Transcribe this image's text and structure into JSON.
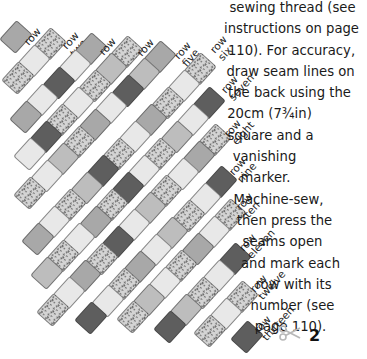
{
  "instructions": {
    "lines": [
      {
        "text": "sewing thread (see",
        "indent": 8
      },
      {
        "text": "instructions on page",
        "indent": 6
      },
      {
        "text": "110). For accuracy,",
        "indent": 6
      },
      {
        "text": "draw seam lines on",
        "indent": 4
      },
      {
        "text": "the back using the",
        "indent": 2
      },
      {
        "text": "20cm (7¾in)",
        "indent": -38
      },
      {
        "text": "square and a",
        "indent": -36
      },
      {
        "text": "vanishing",
        "indent": -48
      },
      {
        "text": "marker.",
        "indent": -46
      },
      {
        "text": "Machine-sew,",
        "indent": -20
      },
      {
        "text": "then press the",
        "indent": -8
      },
      {
        "text": "seams open",
        "indent": -12
      },
      {
        "text": "and mark each",
        "indent": 4
      },
      {
        "text": "row with its",
        "indent": 10
      },
      {
        "text": "number (see",
        "indent": 8
      },
      {
        "text": "page 110).",
        "indent": 4
      }
    ]
  },
  "step": {
    "number": "2",
    "icon": "scissors-icon"
  },
  "colors": {
    "M": "#a8a8a8",
    "G": "#bdbdbd",
    "L": "#e8e8e8",
    "D": "#5e5e5e",
    "T": "#d4d4d4"
  },
  "quilt": {
    "step_x": -16.2,
    "step_y": 17.0,
    "rotation_deg": 42,
    "rows": [
      {
        "label": "row\none",
        "x": 16,
        "y": 37,
        "label_x": 22,
        "label_y": 34,
        "shades": [
          "M"
        ]
      },
      {
        "label": "row\ntwo",
        "x": 50,
        "y": 44,
        "label_x": 60,
        "label_y": 38,
        "shades": [
          "T",
          "L",
          "T"
        ]
      },
      {
        "label": "row\nthree",
        "x": 91,
        "y": 49,
        "label_x": 97,
        "label_y": 44,
        "shades": [
          "M",
          "L",
          "D",
          "L",
          "M"
        ]
      },
      {
        "label": "row\nfour",
        "x": 127,
        "y": 52,
        "label_x": 135,
        "label_y": 45,
        "shades": [
          "T",
          "G",
          "T",
          "L",
          "T",
          "D",
          "L"
        ]
      },
      {
        "label": "row\nfive",
        "x": 160,
        "y": 57,
        "label_x": 172,
        "label_y": 48,
        "shades": [
          "M",
          "G",
          "D",
          "L",
          "M",
          "T",
          "G",
          "L",
          "T"
        ]
      },
      {
        "label": "row\nsix",
        "x": 200,
        "y": 69,
        "label_x": 208,
        "label_y": 42,
        "shades": [
          "T",
          "L",
          "T",
          "M",
          "L",
          "T",
          "D",
          "G",
          "T",
          "L",
          "M"
        ]
      },
      {
        "label": "row\nseven",
        "x": 209,
        "y": 103,
        "label_x": 219,
        "label_y": 82,
        "shades": [
          "D",
          "L",
          "G",
          "T",
          "L",
          "D",
          "T",
          "M",
          "L",
          "T",
          "G"
        ]
      },
      {
        "label": "row\neight",
        "x": 215,
        "y": 140,
        "label_x": 222,
        "label_y": 126,
        "shades": [
          "T",
          "M",
          "L",
          "T",
          "G",
          "L",
          "D",
          "T",
          "M",
          "L",
          "T"
        ]
      },
      {
        "label": "row\nnine",
        "x": 221,
        "y": 182,
        "label_x": 227,
        "label_y": 164,
        "shades": [
          "D",
          "L",
          "T",
          "G",
          "L",
          "M",
          "T",
          "L",
          "D"
        ]
      },
      {
        "label": "row\nten",
        "x": 230,
        "y": 215,
        "label_x": 234,
        "label_y": 199,
        "shades": [
          "T",
          "L",
          "M",
          "T",
          "L",
          "G",
          "T"
        ]
      },
      {
        "label": "row\neleven",
        "x": 235,
        "y": 259,
        "label_x": 237,
        "label_y": 240,
        "shades": [
          "D",
          "L",
          "T",
          "G",
          "D"
        ]
      },
      {
        "label": "row\ntwelve",
        "x": 242,
        "y": 297,
        "label_x": 248,
        "label_y": 281,
        "shades": [
          "T",
          "L",
          "T"
        ]
      },
      {
        "label": "row\nthirteen",
        "x": 247,
        "y": 337,
        "label_x": 252,
        "label_y": 322,
        "shades": [
          "D"
        ]
      }
    ]
  }
}
